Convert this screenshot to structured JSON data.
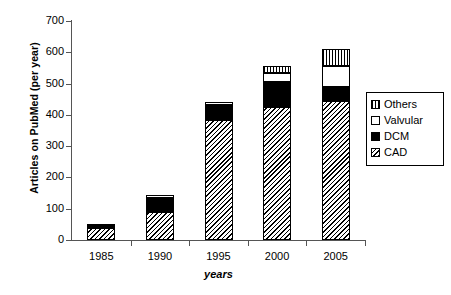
{
  "chart_data": {
    "type": "bar",
    "stacked": true,
    "title": "",
    "xlabel": "years",
    "ylabel": "Articles on PubMed (per year)",
    "categories": [
      "1985",
      "1990",
      "1995",
      "2000",
      "2005"
    ],
    "ylim": [
      0,
      700
    ],
    "yticks": [
      0,
      100,
      200,
      300,
      400,
      500,
      600,
      700
    ],
    "ytick_labels": [
      "0",
      "100",
      "200",
      "300",
      "400",
      "500",
      "600",
      "700"
    ],
    "grid": false,
    "legend_position": "right",
    "series": [
      {
        "name": "CAD",
        "pattern": "diagonal-hatch",
        "color": "#000000",
        "values": [
          40,
          88,
          385,
          425,
          445
        ]
      },
      {
        "name": "DCM",
        "pattern": "solid-black",
        "color": "#000000",
        "values": [
          12,
          45,
          45,
          80,
          45
        ]
      },
      {
        "name": "Valvular",
        "pattern": "white",
        "color": "#ffffff",
        "values": [
          0,
          10,
          10,
          30,
          65
        ]
      },
      {
        "name": "Others",
        "pattern": "vertical-stripes",
        "color": "#000000",
        "values": [
          0,
          0,
          0,
          20,
          55
        ]
      }
    ],
    "totals": [
      52,
      143,
      440,
      555,
      610
    ],
    "legend_order": [
      "Others",
      "Valvular",
      "DCM",
      "CAD"
    ]
  },
  "legend": {
    "items": [
      {
        "label": "Others",
        "swatch": "vertical-stripes-swatch"
      },
      {
        "label": "Valvular",
        "swatch": "white-swatch"
      },
      {
        "label": "DCM",
        "swatch": "black-swatch"
      },
      {
        "label": "CAD",
        "swatch": "diagonal-hatch-swatch"
      }
    ]
  },
  "axes": {
    "y_title": "Articles on PubMed (per year)",
    "x_title": "years"
  }
}
